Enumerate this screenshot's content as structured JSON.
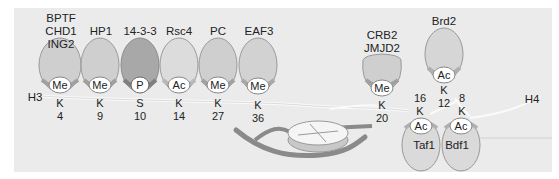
{
  "diagram": {
    "histones": [
      {
        "name": "H3",
        "label": "H3"
      },
      {
        "name": "H4",
        "label": "H4"
      }
    ],
    "h3_readers": [
      {
        "proteins": "BPTF\nCHD1\nING2",
        "mark": "Me",
        "residue": "K",
        "position": "4"
      },
      {
        "proteins": "HP1",
        "mark": "Me",
        "residue": "K",
        "position": "9"
      },
      {
        "proteins": "14-3-3",
        "mark": "P",
        "residue": "S",
        "position": "10"
      },
      {
        "proteins": "Rsc4",
        "mark": "Ac",
        "residue": "K",
        "position": "14"
      },
      {
        "proteins": "PC",
        "mark": "Me",
        "residue": "K",
        "position": "27"
      },
      {
        "proteins": "EAF3",
        "mark": "Me",
        "residue": "K",
        "position": "36"
      }
    ],
    "h4_region": {
      "crb2": {
        "proteins": "CRB2\nJMJD2",
        "mark": "Me",
        "residue": "K",
        "position": "20"
      },
      "brd2": {
        "proteins": "Brd2",
        "mark": "Ac",
        "residue": "K",
        "position": "12"
      },
      "taf1": {
        "proteins": "Taf1",
        "mark": "Ac",
        "residue": "K",
        "position": "16"
      },
      "bdf1": {
        "proteins": "Bdf1",
        "mark": "Ac",
        "residue": "K",
        "position": "8"
      }
    },
    "colors": {
      "background": "#ebebeb",
      "me_reader": "#cfcfcf",
      "p_reader": "#a8a8a8",
      "ac_reader": "#dcdcdc",
      "dna": "#8a8a8a",
      "tail": "#fafafa"
    }
  }
}
